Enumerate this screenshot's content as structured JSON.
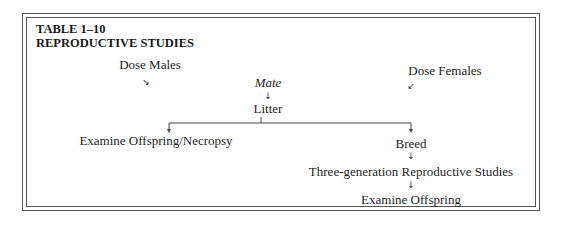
{
  "table": {
    "number": "TABLE 1–10",
    "title": "REPRODUCTIVE STUDIES"
  },
  "nodes": {
    "dose_males": "Dose Males",
    "dose_females": "Dose Females",
    "mate": "Mate",
    "litter": "Litter",
    "examine_offspring_necropsy": "Examine Offspring/Necropsy",
    "breed": "Breed",
    "three_generation": "Three-generation Reproductive Studies",
    "examine_offspring": "Examine Offspring"
  },
  "arrows": {
    "down_right": "↘",
    "down_left": "↙",
    "down": "↓"
  },
  "edges": [
    {
      "from": "dose_males",
      "to": "mate"
    },
    {
      "from": "dose_females",
      "to": "mate"
    },
    {
      "from": "mate",
      "to": "litter"
    },
    {
      "from": "litter",
      "to": "examine_offspring_necropsy"
    },
    {
      "from": "litter",
      "to": "breed"
    },
    {
      "from": "breed",
      "to": "three_generation"
    },
    {
      "from": "three_generation",
      "to": "examine_offspring"
    }
  ]
}
